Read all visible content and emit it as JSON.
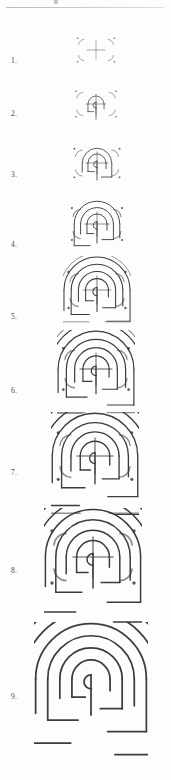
{
  "page": {
    "background_color": "#fdfdfc",
    "rule_color": "#c4c4c4",
    "seed_stroke_color": "#8e8e8e",
    "path_stroke_color": "#3c3c3c",
    "dot_color": "#5c5c5c",
    "label_color": "#4a4a4a",
    "width": 171,
    "height": 780
  },
  "header": {
    "rule_present": true,
    "mark_present": true
  },
  "steps": [
    {
      "number": "1.",
      "label_y": 56,
      "fig_x": 74,
      "fig_y": 28,
      "size": 44,
      "scale": 0.46,
      "arcs_drawn": 0,
      "seed_visible": true,
      "description": "seed pattern: cross, four dots, four corner arcs"
    },
    {
      "number": "2.",
      "label_y": 109,
      "fig_x": 72,
      "fig_y": 80,
      "size": 48,
      "scale": 0.5,
      "arcs_drawn": 1,
      "seed_visible": true,
      "description": "first arc joins cross top to upper-left dot"
    },
    {
      "number": "3.",
      "label_y": 170,
      "fig_x": 70,
      "fig_y": 136,
      "size": 54,
      "scale": 0.56,
      "arcs_drawn": 2,
      "seed_visible": true,
      "description": "second arc joins upper-left arc end to upper-right arc end"
    },
    {
      "number": "4.",
      "label_y": 240,
      "fig_x": 67,
      "fig_y": 194,
      "size": 60,
      "scale": 0.63,
      "arcs_drawn": 3,
      "seed_visible": true,
      "description": "third arc sweeps over to the left quadrant"
    },
    {
      "number": "5.",
      "label_y": 312,
      "fig_x": 63,
      "fig_y": 256,
      "size": 68,
      "scale": 0.71,
      "arcs_drawn": 4,
      "seed_visible": true,
      "description": "fourth arc nests outside the previous"
    },
    {
      "number": "6.",
      "label_y": 386,
      "fig_x": 57,
      "fig_y": 330,
      "size": 78,
      "scale": 0.82,
      "arcs_drawn": 5,
      "seed_visible": true,
      "description": "fifth arc continues the spiral"
    },
    {
      "number": "7.",
      "label_y": 468,
      "fig_x": 51,
      "fig_y": 412,
      "size": 88,
      "scale": 0.92,
      "arcs_drawn": 6,
      "seed_visible": true,
      "description": "sixth arc nearly encloses the figure"
    },
    {
      "number": "8.",
      "label_y": 566,
      "fig_x": 44,
      "fig_y": 508,
      "size": 98,
      "scale": 1.02,
      "arcs_drawn": 7,
      "seed_visible": true,
      "description": "seventh arc completes the seventh circuit"
    },
    {
      "number": "9.",
      "label_y": 692,
      "fig_x": 34,
      "fig_y": 622,
      "size": 114,
      "scale": 1.19,
      "arcs_drawn": 8,
      "seed_visible": false,
      "description": "completed seven-circuit classical labyrinth"
    }
  ]
}
